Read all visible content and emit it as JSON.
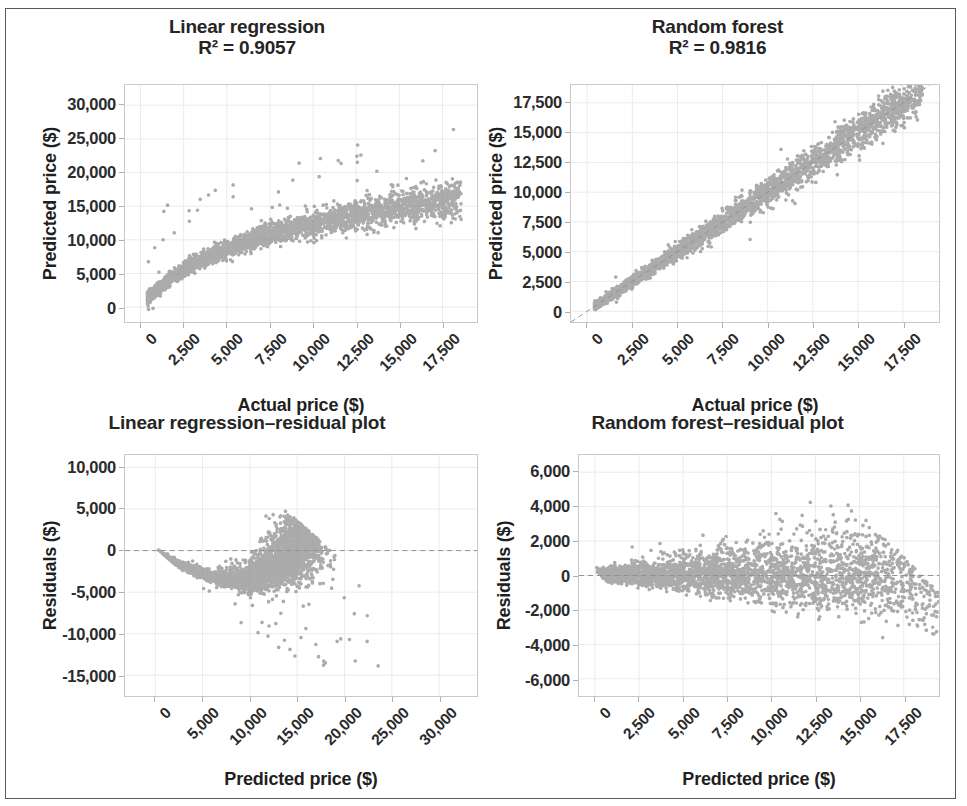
{
  "figure": {
    "width": 967,
    "height": 806,
    "background": "#ffffff",
    "frame_color": "#5a5a5a",
    "point_color": "#8a8a8a",
    "grid_color": "#ebebeb",
    "axis_color": "#c9c9c9",
    "reference_line_color": "#909090"
  },
  "chart_data": [
    {
      "id": "linear-regression-scatter",
      "type": "scatter",
      "title": "Linear regression\nR² = 0.9057",
      "title_lines": [
        "Linear regression",
        "R² = 0.9057"
      ],
      "r_squared": 0.9057,
      "model": "Linear regression",
      "xlabel": "Actual price ($)",
      "ylabel": "Predicted price ($)",
      "xlim": [
        -900,
        19500
      ],
      "ylim": [
        -2200,
        33000
      ],
      "xticks": [
        0,
        2500,
        5000,
        7500,
        10000,
        12500,
        15000,
        17500
      ],
      "xticklabels": [
        "0",
        "2,500",
        "5,000",
        "7,500",
        "10,000",
        "12,500",
        "15,000",
        "17,500"
      ],
      "yticks": [
        0,
        5000,
        10000,
        15000,
        20000,
        25000,
        30000
      ],
      "yticklabels": [
        "0",
        "5,000",
        "10,000",
        "15,000",
        "20,000",
        "25,000",
        "30,000"
      ],
      "grid": true,
      "legend": "none",
      "n_points": 3400,
      "shape": "concave-log",
      "seed": 11,
      "description": "Predicted vs actual price; points follow a saturating log-shaped band that underpredicts at high actual price, with a scatter of high outliers up to 30,000."
    },
    {
      "id": "random-forest-scatter",
      "type": "scatter",
      "title": "Random forest\nR² = 0.9816",
      "title_lines": [
        "Random forest",
        "R² = 0.9816"
      ],
      "r_squared": 0.9816,
      "model": "Random forest",
      "xlabel": "Actual price ($)",
      "ylabel": "Predicted price ($)",
      "xlim": [
        -900,
        19500
      ],
      "ylim": [
        -900,
        19000
      ],
      "xticks": [
        0,
        2500,
        5000,
        7500,
        10000,
        12500,
        15000,
        17500
      ],
      "xticklabels": [
        "0",
        "2,500",
        "5,000",
        "7,500",
        "10,000",
        "12,500",
        "15,000",
        "17,500"
      ],
      "yticks": [
        0,
        2500,
        5000,
        7500,
        10000,
        12500,
        15000,
        17500
      ],
      "yticklabels": [
        "0",
        "2,500",
        "5,000",
        "7,500",
        "10,000",
        "12,500",
        "15,000",
        "17,500"
      ],
      "grid": true,
      "legend": "none",
      "reference_line": "y = x (dashed)",
      "n_points": 3400,
      "shape": "tight-diagonal",
      "seed": 23,
      "description": "Predicted vs actual price tightly hugging the 1:1 dashed diagonal with spread widening slightly at higher prices."
    },
    {
      "id": "linear-regression-residuals",
      "type": "scatter",
      "title": "Linear regression–residual plot",
      "title_lines": [
        "Linear regression–residual plot"
      ],
      "model": "Linear regression",
      "xlabel": "Predicted price ($)",
      "ylabel": "Residuals ($)",
      "xlim": [
        -3200,
        34000
      ],
      "ylim": [
        -17500,
        11500
      ],
      "xticks": [
        0,
        5000,
        10000,
        15000,
        20000,
        25000,
        30000
      ],
      "xticklabels": [
        "0",
        "5,000",
        "10,000",
        "15,000",
        "20,000",
        "25,000",
        "30,000"
      ],
      "yticks": [
        10000,
        5000,
        0,
        -5000,
        -10000,
        -15000
      ],
      "yticklabels": [
        "10,000",
        "5,000",
        "0",
        "-5,000",
        "-10,000",
        "-15,000"
      ],
      "grid": true,
      "legend": "none",
      "reference_line": "y = 0 (dashed)",
      "n_points": 3400,
      "shape": "wedge-curved",
      "seed": 37,
      "description": "Residuals show strong curved pattern: a dipping wedge from 0 to about 10,000 predicted, a dense cluster near 10,000-13,000 reaching +7,000, then sparse strong negative outliers down to -16,000 at high predicted prices."
    },
    {
      "id": "random-forest-residuals",
      "type": "scatter",
      "title": "Random forest–residual plot",
      "title_lines": [
        "Random forest–residual plot"
      ],
      "model": "Random forest",
      "xlabel": "Predicted price ($)",
      "ylabel": "Residuals ($)",
      "xlim": [
        -900,
        19500
      ],
      "ylim": [
        -7000,
        7000
      ],
      "xticks": [
        0,
        2500,
        5000,
        7500,
        10000,
        12500,
        15000,
        17500
      ],
      "xticklabels": [
        "0",
        "2,500",
        "5,000",
        "7,500",
        "10,000",
        "12,500",
        "15,000",
        "17,500"
      ],
      "yticks": [
        6000,
        4000,
        2000,
        0,
        -2000,
        -4000,
        -6000
      ],
      "yticklabels": [
        "6,000",
        "4,000",
        "2,000",
        "0",
        "-2,000",
        "-4,000",
        "-6,000"
      ],
      "grid": true,
      "legend": "none",
      "reference_line": "y = 0 (dashed)",
      "n_points": 3400,
      "shape": "horizontal-fan",
      "seed": 59,
      "description": "Residuals centered on zero forming a horizontal fan that widens with predicted price, from near zero spread at low prices to roughly ±4,000 at 17,500."
    }
  ],
  "layout": {
    "panels": [
      {
        "chart": 0,
        "left": 14,
        "top": 16,
        "width": 466,
        "height": 390,
        "plot": {
          "left": 110,
          "top": 68,
          "width": 354,
          "height": 239
        }
      },
      {
        "chart": 1,
        "left": 480,
        "top": 16,
        "width": 475,
        "height": 390,
        "plot": {
          "left": 90,
          "top": 68,
          "width": 370,
          "height": 239
        }
      },
      {
        "chart": 2,
        "left": 14,
        "top": 406,
        "width": 466,
        "height": 394,
        "plot": {
          "left": 110,
          "top": 48,
          "width": 354,
          "height": 243
        }
      },
      {
        "chart": 3,
        "left": 480,
        "top": 406,
        "width": 475,
        "height": 394,
        "plot": {
          "left": 98,
          "top": 48,
          "width": 362,
          "height": 243
        }
      }
    ]
  }
}
